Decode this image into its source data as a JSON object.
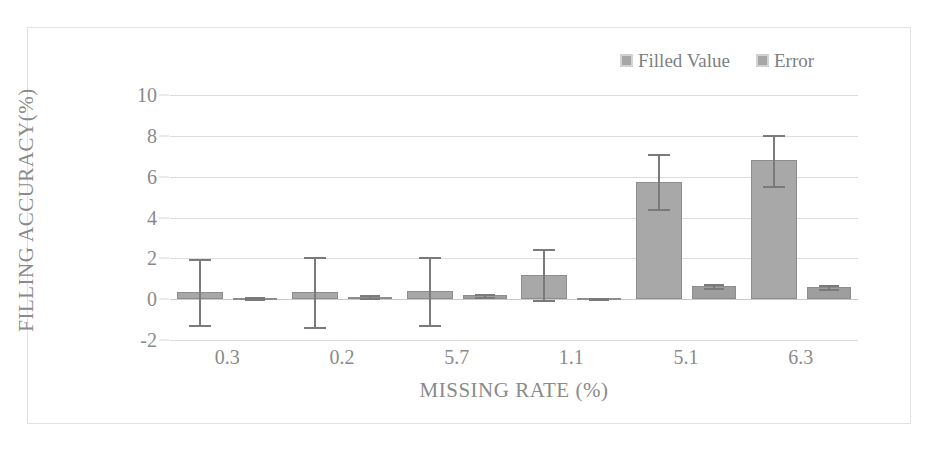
{
  "chart_data": {
    "type": "bar",
    "title": "",
    "xlabel": "MISSING RATE (%)",
    "ylabel": "FILLING ACCURACY(%)",
    "categories": [
      "0.3",
      "0.2",
      "5.7",
      "1.1",
      "5.1",
      "6.3"
    ],
    "ylim": [
      -2,
      10
    ],
    "yticks": [
      10,
      8,
      6,
      4,
      2,
      0,
      -2
    ],
    "grid": true,
    "legend_position": "top-right",
    "series": [
      {
        "name": "Filled Value",
        "color": "#a6a6a6",
        "values": [
          0.35,
          0.35,
          0.4,
          1.2,
          5.75,
          6.8
        ],
        "errors": [
          1.6,
          1.7,
          1.65,
          1.25,
          1.35,
          1.25
        ]
      },
      {
        "name": "Error",
        "color": "#a6a6a6",
        "values": [
          0.05,
          0.12,
          0.18,
          0.04,
          0.65,
          0.6
        ],
        "errors": [
          0.04,
          0.06,
          0.08,
          0.04,
          0.1,
          0.1
        ]
      }
    ]
  },
  "legend": {
    "entries": [
      {
        "label": "Filled Value"
      },
      {
        "label": "Error"
      }
    ]
  },
  "axes": {
    "x_title": "MISSING RATE (%)",
    "y_title": "FILLING ACCURACY(%)"
  },
  "colors": {
    "bar_fill": "#a6a6a6",
    "bar_outline": "#8d8d8d",
    "gridline": "#dcdcdc",
    "text": "#8a8a8a",
    "frame": "#e2e2e2"
  }
}
